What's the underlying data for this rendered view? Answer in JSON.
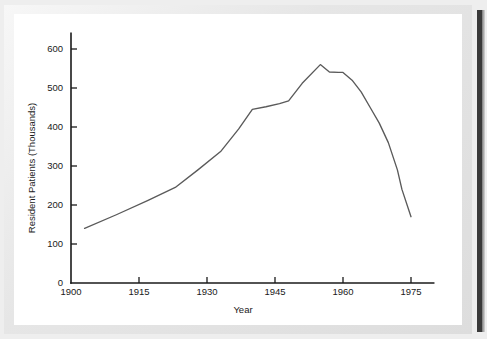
{
  "chart_data": {
    "type": "line",
    "title": "",
    "xlabel": "Year",
    "ylabel": "Resident Patients (Thousands)",
    "xlim": [
      1900,
      1980
    ],
    "ylim": [
      0,
      640
    ],
    "grid": false,
    "legend": null,
    "x_ticks": [
      1900,
      1915,
      1930,
      1945,
      1960,
      1975
    ],
    "x_tick_labels": [
      "1900",
      "1915",
      "1930",
      "1945",
      "1960",
      "1975"
    ],
    "y_ticks": [
      0,
      100,
      200,
      300,
      400,
      500,
      600
    ],
    "y_tick_labels": [
      "0",
      "100",
      "200",
      "300",
      "400",
      "500",
      "600"
    ],
    "series": [
      {
        "name": "Resident Patients",
        "color": "#5a5a5a",
        "x": [
          1903,
          1910,
          1917,
          1923,
          1928,
          1933,
          1937,
          1940,
          1943,
          1946,
          1948,
          1951,
          1955,
          1957,
          1959,
          1960,
          1962,
          1964,
          1966,
          1968,
          1970,
          1972,
          1973,
          1975
        ],
        "values": [
          140,
          175,
          212,
          245,
          290,
          337,
          395,
          445,
          452,
          460,
          467,
          512,
          560,
          541,
          540,
          540,
          520,
          490,
          450,
          410,
          360,
          290,
          240,
          170
        ]
      }
    ],
    "annotations": []
  },
  "axis_labels": {
    "y_title": "Resident Patients (Thousands)",
    "x_title": "Year"
  },
  "colors": {
    "line": "#5a5a5a",
    "axis": "#1a1a1a",
    "plot_background": "#ffffff",
    "mat": "#eeeeee",
    "spine": "#3a3a3a"
  }
}
